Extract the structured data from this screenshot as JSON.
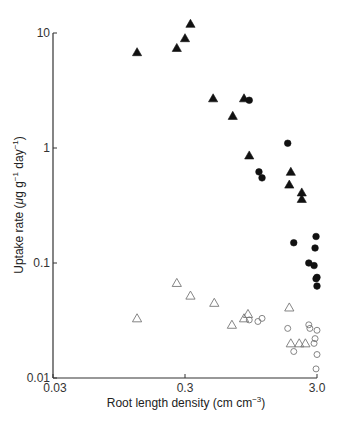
{
  "chart_data": {
    "type": "scatter",
    "title": "",
    "xlabel": "Root length density (cm cm⁻³)",
    "ylabel": "Uptake rate (μg g⁻¹ day⁻¹)",
    "xscale": "log",
    "yscale": "log",
    "xlim": [
      0.03,
      3.0
    ],
    "ylim": [
      0.01,
      10
    ],
    "x_ticks": [
      0.03,
      0.3,
      3.0
    ],
    "x_tick_labels": [
      "0.03",
      "0.3",
      "3.0"
    ],
    "y_ticks": [
      0.01,
      0.1,
      1,
      10
    ],
    "y_tick_labels": [
      "0.01",
      "0.1",
      "1",
      "10"
    ],
    "grid": false,
    "legend": null,
    "series": [
      {
        "name": "filled-triangles",
        "marker": "triangle",
        "filled": true,
        "points": [
          [
            0.13,
            6.8
          ],
          [
            0.26,
            7.4
          ],
          [
            0.3,
            9.0
          ],
          [
            0.33,
            12.0
          ],
          [
            0.49,
            2.7
          ],
          [
            0.69,
            1.9
          ],
          [
            0.84,
            2.7
          ],
          [
            0.92,
            0.86
          ],
          [
            1.9,
            0.62
          ],
          [
            1.85,
            0.48
          ],
          [
            2.3,
            0.41
          ],
          [
            2.3,
            0.36
          ]
        ]
      },
      {
        "name": "filled-circles",
        "marker": "circle",
        "filled": true,
        "points": [
          [
            0.92,
            2.6
          ],
          [
            1.09,
            0.62
          ],
          [
            1.15,
            0.55
          ],
          [
            1.8,
            1.1
          ],
          [
            2.0,
            0.15
          ],
          [
            2.6,
            0.1
          ],
          [
            2.85,
            0.095
          ],
          [
            3.0,
            0.075
          ],
          [
            3.0,
            0.063
          ],
          [
            2.95,
            0.17
          ],
          [
            2.9,
            0.135
          ],
          [
            2.95,
            0.073
          ]
        ]
      },
      {
        "name": "open-triangles",
        "marker": "triangle",
        "filled": false,
        "points": [
          [
            0.13,
            0.033
          ],
          [
            0.26,
            0.067
          ],
          [
            0.33,
            0.052
          ],
          [
            0.5,
            0.045
          ],
          [
            0.68,
            0.029
          ],
          [
            0.84,
            0.033
          ],
          [
            0.9,
            0.036
          ],
          [
            1.85,
            0.041
          ],
          [
            1.9,
            0.02
          ],
          [
            2.2,
            0.02
          ],
          [
            2.45,
            0.02
          ]
        ]
      },
      {
        "name": "open-circles",
        "marker": "circle",
        "filled": false,
        "points": [
          [
            0.92,
            0.032
          ],
          [
            1.07,
            0.031
          ],
          [
            1.15,
            0.033
          ],
          [
            1.8,
            0.027
          ],
          [
            2.0,
            0.017
          ],
          [
            2.6,
            0.029
          ],
          [
            2.65,
            0.027
          ],
          [
            3.0,
            0.026
          ],
          [
            2.85,
            0.02
          ],
          [
            2.9,
            0.022
          ],
          [
            3.0,
            0.016
          ],
          [
            2.95,
            0.012
          ]
        ]
      }
    ]
  },
  "axes": {
    "x_title": "Root length density (cm cm",
    "x_title_sup": "−3",
    "x_title_end": ")",
    "y_title_pre": "Uptake rate (",
    "y_title_mu": "μ",
    "y_title_mid": "g g",
    "y_title_sup1": "−1",
    "y_title_day": " day",
    "y_title_sup2": "−1",
    "y_title_end": ")"
  }
}
